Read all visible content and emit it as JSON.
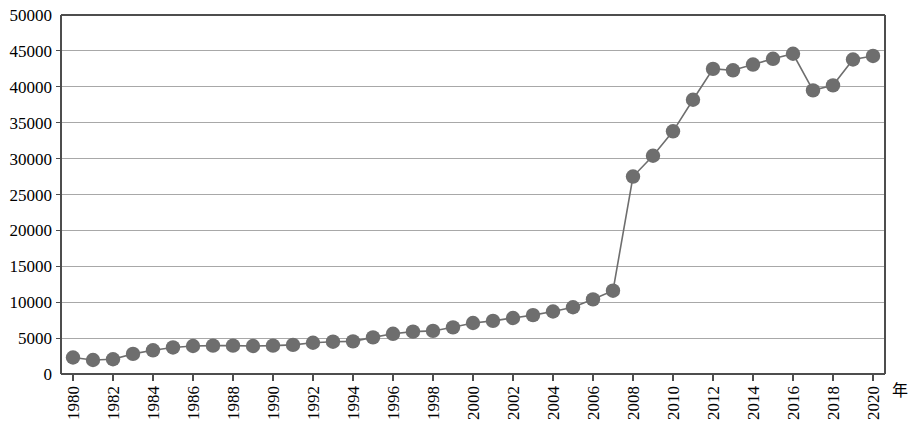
{
  "chart_data": {
    "type": "line",
    "title": "",
    "subtitle": "",
    "xlabel": "年",
    "ylabel": "",
    "xlim": [
      1979.4,
      2020.6
    ],
    "ylim": [
      0,
      50000
    ],
    "grid": true,
    "legend": false,
    "marker": "circle",
    "series_color": "#6e6e6e",
    "grid_color": "#a8a8a8",
    "axis_color": "#4d4d4d",
    "y_ticks": [
      0,
      5000,
      10000,
      15000,
      20000,
      25000,
      30000,
      35000,
      40000,
      45000,
      50000
    ],
    "y_tick_labels": [
      "0",
      "5000",
      "10000",
      "15000",
      "20000",
      "25000",
      "30000",
      "35000",
      "40000",
      "45000",
      "50000"
    ],
    "x_ticks": [
      1980,
      1982,
      1984,
      1986,
      1988,
      1990,
      1992,
      1994,
      1996,
      1998,
      2000,
      2002,
      2004,
      2006,
      2008,
      2010,
      2012,
      2014,
      2016,
      2018,
      2020
    ],
    "x_tick_labels": [
      "1980",
      "1982",
      "1984",
      "1986",
      "1988",
      "1990",
      "1992",
      "1994",
      "1996",
      "1998",
      "2000",
      "2002",
      "2004",
      "2006",
      "2008",
      "2010",
      "2012",
      "2014",
      "2016",
      "2018",
      "2020"
    ],
    "x": [
      1980,
      1981,
      1982,
      1983,
      1984,
      1985,
      1986,
      1987,
      1988,
      1989,
      1990,
      1991,
      1992,
      1993,
      1994,
      1995,
      1996,
      1997,
      1998,
      1999,
      2000,
      2001,
      2002,
      2003,
      2004,
      2005,
      2006,
      2007,
      2008,
      2009,
      2010,
      2011,
      2012,
      2013,
      2014,
      2015,
      2016,
      2017,
      2018,
      2019,
      2020
    ],
    "values": [
      2300,
      1950,
      2050,
      2800,
      3300,
      3700,
      3900,
      3950,
      3950,
      3900,
      3950,
      4050,
      4350,
      4500,
      4550,
      5100,
      5600,
      5900,
      6000,
      6500,
      7100,
      7400,
      7800,
      8200,
      8700,
      9300,
      10400,
      11600,
      27500,
      30400,
      33800,
      38200,
      42500,
      42300,
      43100,
      43900,
      44600,
      39500,
      40200,
      43800,
      44300
    ],
    "annotations": []
  }
}
